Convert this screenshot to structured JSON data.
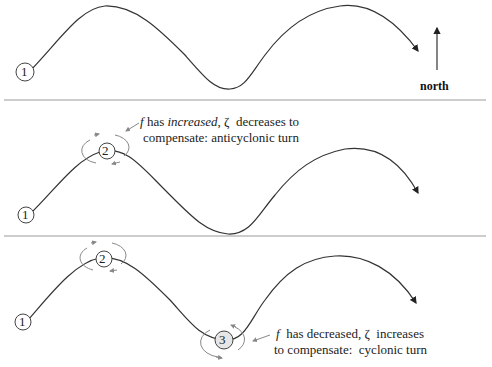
{
  "compass": {
    "label": "north"
  },
  "markers": {
    "one": "1",
    "two": "2",
    "three": "3"
  },
  "panels": [
    {
      "id": "top",
      "description": "Wave path starting at point 1"
    },
    {
      "id": "middle",
      "annotation": {
        "f": "f",
        "part1": " has ",
        "increased": "increased",
        "part2": ", ",
        "zeta": "ζ",
        "part3": "  decreases to",
        "line2": "compensate: anticyclonic turn"
      }
    },
    {
      "id": "bottom",
      "annotation": {
        "f": "f",
        "part1": "  has decreased, ",
        "zeta": "ζ",
        "part3": "  increases",
        "line2": "to compensate:  cyclonic turn"
      }
    }
  ],
  "colors": {
    "line": "#333333",
    "divider": "#999999",
    "rotation": "#888888"
  }
}
